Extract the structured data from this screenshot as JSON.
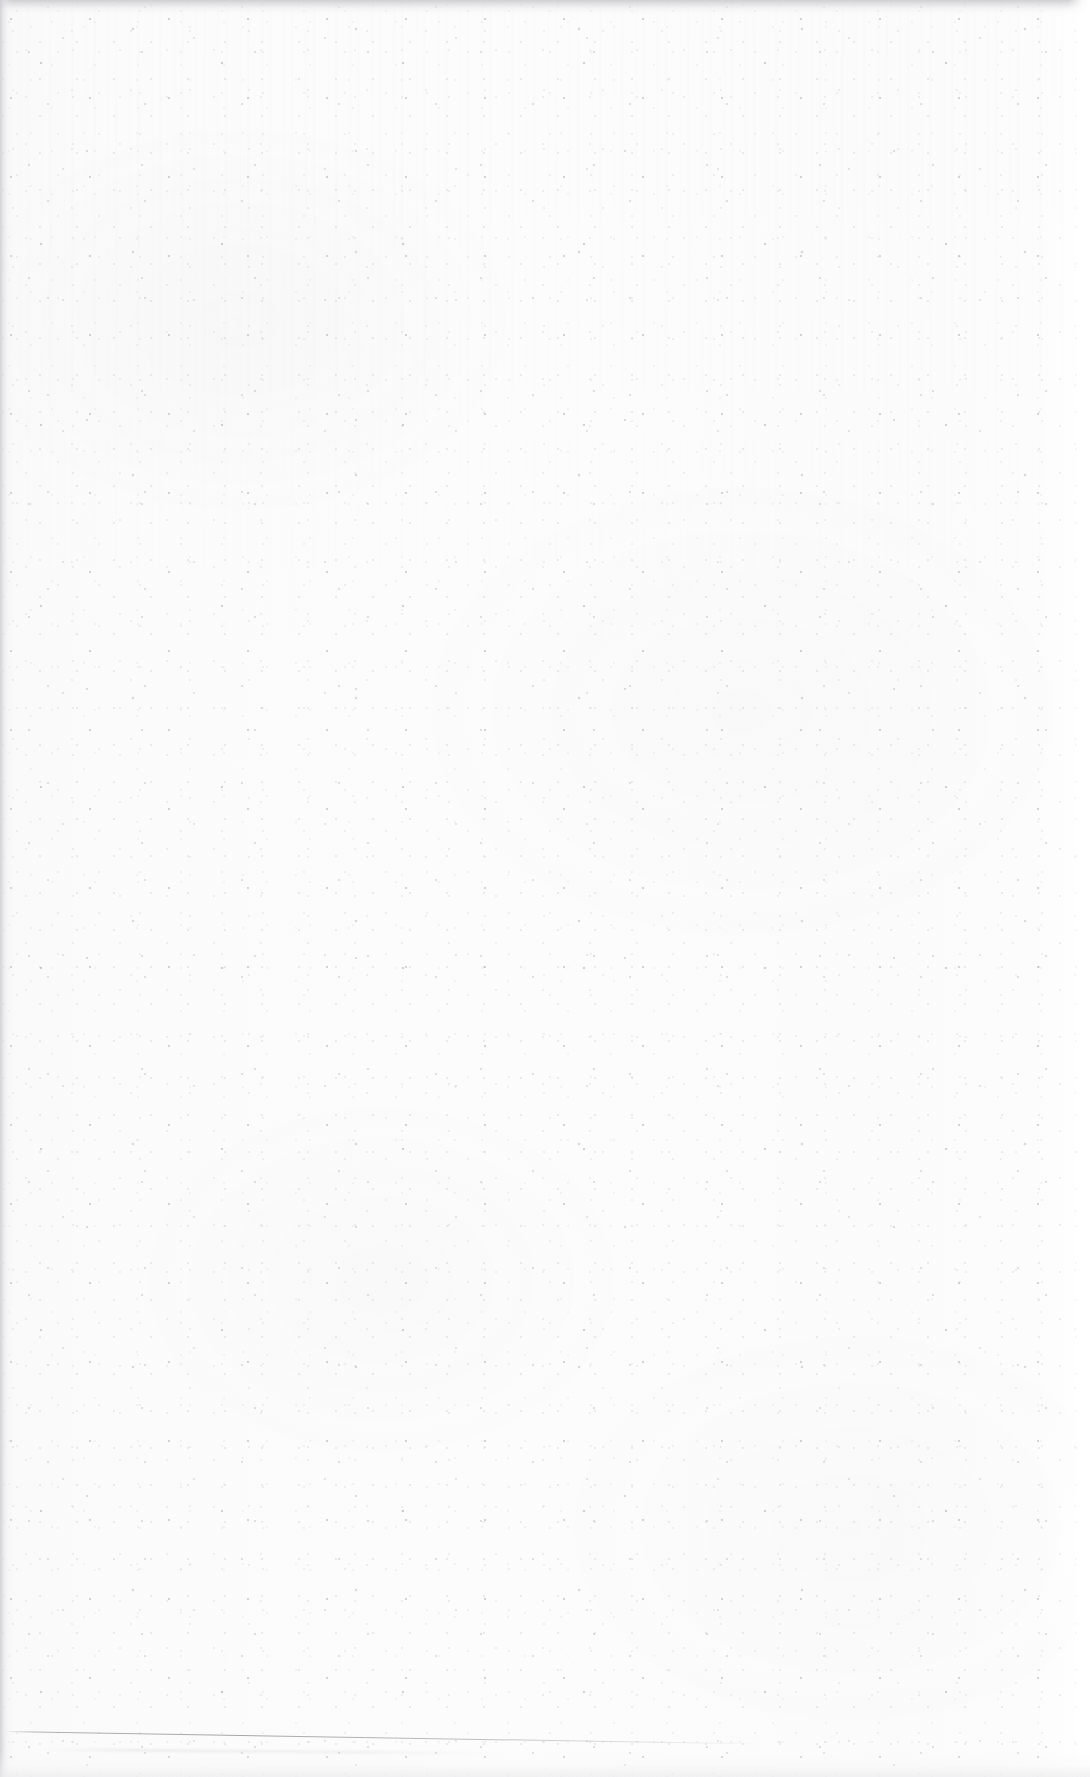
{
  "page": {
    "kind": "blank-scanned-page",
    "width_px": 1090,
    "height_px": 1777,
    "orientation": "portrait",
    "text_content": "",
    "has_text": false,
    "has_images": false,
    "has_tables": false
  },
  "paper": {
    "base_color": "#fbfbfb",
    "highlight_color": "#ffffff",
    "shadow_color": "#f2f2f2",
    "speckle_color": "#78787d",
    "fleck_color": "#5f5f66",
    "dust_color": "#46464e"
  },
  "artifacts": {
    "top_edge": {
      "name": "scan-top-shadow",
      "color": "#cdcdd0",
      "height_px": 14
    },
    "left_edge": {
      "name": "scan-left-shadow",
      "color": "#cecee2",
      "width_px": 12
    },
    "right_edge": {
      "name": "scan-right-highlight",
      "color": "#ffffff",
      "width_px": 22
    },
    "bottom_edge": {
      "name": "scan-bottom-shadow",
      "color": "#ececee",
      "height_px": 26
    },
    "hairline": {
      "name": "page-edge-hairline",
      "color": "#8a8a91",
      "start_x": 4,
      "start_y": 1731,
      "length_px": 760,
      "angle_deg": 0.95
    },
    "streaks": {
      "name": "vertical-scanner-streaks",
      "color": "#8c8c92",
      "region": "upper-third"
    }
  }
}
